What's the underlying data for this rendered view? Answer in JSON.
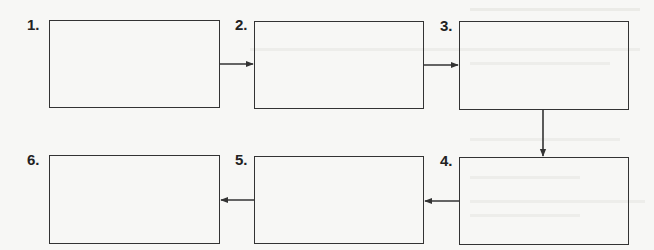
{
  "diagram": {
    "type": "sequence-flowchart",
    "flow_order": [
      "1",
      "2",
      "3",
      "4",
      "5",
      "6"
    ],
    "steps": [
      {
        "label": "1.",
        "content": ""
      },
      {
        "label": "2.",
        "content": ""
      },
      {
        "label": "3.",
        "content": ""
      },
      {
        "label": "4.",
        "content": ""
      },
      {
        "label": "5.",
        "content": ""
      },
      {
        "label": "6.",
        "content": ""
      }
    ],
    "connectors": [
      {
        "from": "1",
        "to": "2",
        "direction": "right"
      },
      {
        "from": "2",
        "to": "3",
        "direction": "right"
      },
      {
        "from": "3",
        "to": "4",
        "direction": "down"
      },
      {
        "from": "4",
        "to": "5",
        "direction": "left"
      },
      {
        "from": "5",
        "to": "6",
        "direction": "left"
      }
    ],
    "colors": {
      "stroke": "#333333",
      "label": "#222222",
      "background": "#f7f7f5"
    }
  }
}
